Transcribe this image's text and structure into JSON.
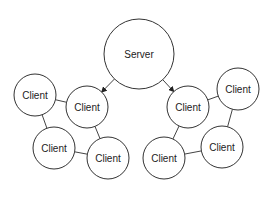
{
  "diagram": {
    "nodes": [
      {
        "id": "server",
        "label": "Server",
        "cx": 139,
        "cy": 54,
        "r": 35
      },
      {
        "id": "c1",
        "label": "Client",
        "cx": 35,
        "cy": 95,
        "r": 21
      },
      {
        "id": "c2",
        "label": "Client",
        "cx": 87,
        "cy": 107,
        "r": 21
      },
      {
        "id": "c3",
        "label": "Client",
        "cx": 54,
        "cy": 148,
        "r": 21
      },
      {
        "id": "c4",
        "label": "Client",
        "cx": 108,
        "cy": 158,
        "r": 21
      },
      {
        "id": "c5",
        "label": "Client",
        "cx": 188,
        "cy": 107,
        "r": 21
      },
      {
        "id": "c6",
        "label": "Client",
        "cx": 238,
        "cy": 89,
        "r": 21
      },
      {
        "id": "c7",
        "label": "Client",
        "cx": 222,
        "cy": 147,
        "r": 21
      },
      {
        "id": "c8",
        "label": "Client",
        "cx": 164,
        "cy": 158,
        "r": 21
      }
    ],
    "edges": [
      {
        "from": "server",
        "to": "c2",
        "arrow": true
      },
      {
        "from": "server",
        "to": "c5",
        "arrow": true
      },
      {
        "from": "c1",
        "to": "c2",
        "arrow": false
      },
      {
        "from": "c1",
        "to": "c3",
        "arrow": false
      },
      {
        "from": "c2",
        "to": "c4",
        "arrow": false
      },
      {
        "from": "c3",
        "to": "c4",
        "arrow": false
      },
      {
        "from": "c5",
        "to": "c6",
        "arrow": false
      },
      {
        "from": "c5",
        "to": "c8",
        "arrow": false
      },
      {
        "from": "c6",
        "to": "c7",
        "arrow": false
      },
      {
        "from": "c8",
        "to": "c7",
        "arrow": false
      }
    ]
  }
}
